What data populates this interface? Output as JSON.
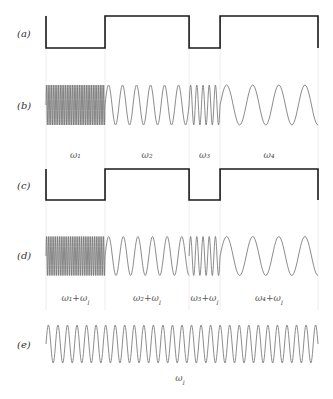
{
  "figure": {
    "type": "frequency-mixing-diagram",
    "segments": 4,
    "segment_boundaries_frac": [
      0,
      0.217,
      0.526,
      0.64,
      1.0
    ],
    "colors": {
      "square": "#1a1a1a",
      "wave": "#6e6e6e",
      "guide": "#e8e8e8",
      "text": "#333333"
    }
  },
  "rows": [
    {
      "id": "a",
      "label": "(a)",
      "kind": "square",
      "levels": [
        0,
        1,
        0,
        1
      ]
    },
    {
      "id": "b",
      "label": "(b)",
      "kind": "sine-segments",
      "cycles": [
        34,
        6,
        5,
        3.75
      ],
      "segment_labels": [
        "ω₁",
        "ω₂",
        "ω₃",
        "ω₄"
      ]
    },
    {
      "id": "c",
      "label": "(c)",
      "kind": "square",
      "levels": [
        0,
        1,
        0,
        1
      ]
    },
    {
      "id": "d",
      "label": "(d)",
      "kind": "sine-segments",
      "cycles": [
        32,
        5.75,
        5,
        3.75
      ],
      "segment_labels": [
        "ω₁+ω",
        "ω₂+ω",
        "ω₃+ω",
        "ω₄+ω"
      ],
      "segment_label_sub": "I"
    },
    {
      "id": "e",
      "label": "(e)",
      "kind": "sine",
      "cycles": 28.5,
      "caption": "ω",
      "caption_sub": "I"
    }
  ]
}
